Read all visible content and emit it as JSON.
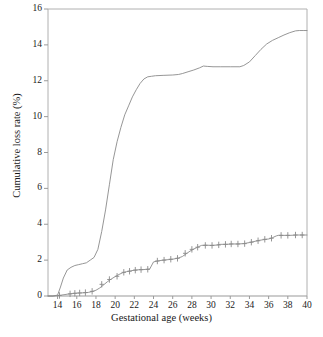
{
  "chart_data": {
    "type": "line",
    "title": "",
    "xlabel": "Gestational age (weeks)",
    "ylabel": "Cumulative loss rate (%)",
    "xlim": [
      13,
      40
    ],
    "ylim": [
      0,
      16
    ],
    "xticks": [
      14,
      16,
      18,
      20,
      22,
      24,
      26,
      28,
      30,
      32,
      34,
      36,
      38,
      40
    ],
    "yticks": [
      0,
      2,
      4,
      6,
      8,
      10,
      12,
      14,
      16
    ],
    "grid": false,
    "legend": "none",
    "line_color": "#8a8a8a",
    "axis_color": "#b0b0b0",
    "series": [
      {
        "name": "upper-curve",
        "marks": "none",
        "x": [
          13.0,
          13.5,
          14.0,
          14.3,
          14.6,
          15.0,
          15.4,
          15.8,
          16.2,
          16.6,
          17.0,
          17.4,
          17.8,
          18.2,
          18.6,
          19.0,
          19.4,
          19.8,
          20.2,
          20.6,
          21.0,
          21.4,
          21.8,
          22.2,
          22.6,
          23.0,
          23.4,
          23.8,
          24.2,
          25.0,
          26.0,
          26.6,
          27.0,
          27.6,
          28.2,
          28.8,
          29.2,
          29.6,
          30.2,
          31.0,
          32.0,
          33.0,
          33.4,
          34.0,
          34.6,
          35.2,
          35.8,
          36.4,
          37.0,
          37.6,
          38.2,
          38.8,
          39.2,
          39.6,
          40.0
        ],
        "y": [
          0.0,
          0.0,
          0.05,
          0.5,
          1.0,
          1.45,
          1.6,
          1.7,
          1.75,
          1.8,
          1.85,
          2.0,
          2.15,
          2.6,
          3.6,
          4.8,
          6.2,
          7.6,
          8.6,
          9.4,
          10.1,
          10.6,
          11.1,
          11.5,
          11.85,
          12.1,
          12.22,
          12.25,
          12.28,
          12.3,
          12.32,
          12.35,
          12.4,
          12.5,
          12.6,
          12.72,
          12.82,
          12.8,
          12.78,
          12.78,
          12.78,
          12.78,
          12.85,
          13.05,
          13.4,
          13.75,
          14.05,
          14.25,
          14.4,
          14.55,
          14.68,
          14.78,
          14.8,
          14.8,
          14.8
        ]
      },
      {
        "name": "lower-curve",
        "marks": "plus",
        "x": [
          13.0,
          13.6,
          14.0,
          14.4,
          15.0,
          15.6,
          16.0,
          16.4,
          16.8,
          17.2,
          17.6,
          18.0,
          18.4,
          18.8,
          19.2,
          19.6,
          20.0,
          20.4,
          20.8,
          21.2,
          21.6,
          22.0,
          22.4,
          22.8,
          23.2,
          23.6,
          24.0,
          24.4,
          25.0,
          25.6,
          26.0,
          26.6,
          27.0,
          27.4,
          27.8,
          28.2,
          28.6,
          29.0,
          29.4,
          30.0,
          30.6,
          31.0,
          31.6,
          32.2,
          32.8,
          33.4,
          34.0,
          34.6,
          35.0,
          35.6,
          36.0,
          36.4,
          36.8,
          37.0,
          37.6,
          38.2,
          39.0,
          39.6,
          40.0
        ],
        "y": [
          0.0,
          0.0,
          0.02,
          0.05,
          0.1,
          0.14,
          0.16,
          0.17,
          0.18,
          0.2,
          0.25,
          0.32,
          0.45,
          0.62,
          0.8,
          0.95,
          1.08,
          1.2,
          1.3,
          1.36,
          1.4,
          1.44,
          1.46,
          1.47,
          1.48,
          1.5,
          1.9,
          1.95,
          2.0,
          2.03,
          2.05,
          2.12,
          2.2,
          2.35,
          2.5,
          2.62,
          2.72,
          2.82,
          2.84,
          2.82,
          2.84,
          2.88,
          2.88,
          2.9,
          2.9,
          2.92,
          2.98,
          3.05,
          3.1,
          3.15,
          3.18,
          3.25,
          3.35,
          3.38,
          3.38,
          3.38,
          3.4,
          3.4,
          3.4
        ],
        "censor_marks_x": [
          14.2,
          15.3,
          15.8,
          16.3,
          16.9,
          17.6,
          18.6,
          19.4,
          20.2,
          20.9,
          21.5,
          22.1,
          22.7,
          23.4,
          24.4,
          25.1,
          25.8,
          26.5,
          27.3,
          28.0,
          28.6,
          29.4,
          30.1,
          30.8,
          31.5,
          32.1,
          32.8,
          33.5,
          34.2,
          34.9,
          35.6,
          36.3,
          37.3,
          38.0,
          38.8,
          39.5
        ],
        "censor_marks_y": [
          0.03,
          0.12,
          0.15,
          0.17,
          0.19,
          0.26,
          0.65,
          0.92,
          1.1,
          1.32,
          1.38,
          1.44,
          1.47,
          1.49,
          1.95,
          2.0,
          2.05,
          2.1,
          2.38,
          2.6,
          2.72,
          2.82,
          2.82,
          2.85,
          2.88,
          2.9,
          2.9,
          2.92,
          3.0,
          3.08,
          3.16,
          3.22,
          3.38,
          3.38,
          3.4,
          3.4
        ]
      }
    ]
  },
  "axes": {
    "xlabel": "Gestational age (weeks)",
    "ylabel": "Cumulative loss rate (%)",
    "xticks": [
      "14",
      "16",
      "18",
      "20",
      "22",
      "24",
      "26",
      "28",
      "30",
      "32",
      "34",
      "36",
      "38",
      "40"
    ],
    "yticks": [
      "0",
      "2",
      "4",
      "6",
      "8",
      "10",
      "12",
      "14",
      "16"
    ]
  }
}
